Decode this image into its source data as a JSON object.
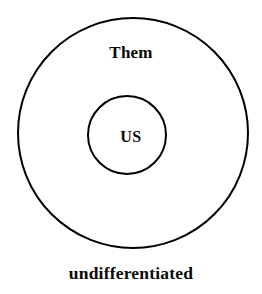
{
  "diagram": {
    "type": "nested-concentric-circles",
    "background_color": "#ffffff",
    "stroke_color": "#000000",
    "text_color": "#0a0a0a",
    "outer_circle": {
      "label": "Them",
      "center_x": 133,
      "center_y": 133,
      "radius": 115,
      "stroke_width": 2,
      "fill": "none"
    },
    "inner_circle": {
      "label": "US",
      "center_x": 127,
      "center_y": 135,
      "radius": 39,
      "stroke_width": 2,
      "fill": "none"
    },
    "caption": "undifferentiated"
  }
}
